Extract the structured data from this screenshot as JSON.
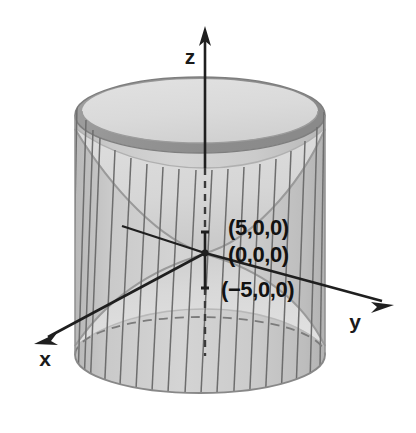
{
  "figure": {
    "background_color": "#ffffff",
    "width": 416,
    "height": 433
  },
  "axes": {
    "z": {
      "label": "z",
      "label_x": 190,
      "label_y": 64,
      "tip_x": 205,
      "tip_y": 30,
      "origin_x": 205,
      "origin_y": 253
    },
    "y": {
      "label": "y",
      "label_x": 355,
      "label_y": 329,
      "tip_x": 392,
      "tip_y": 306,
      "origin_x": 205,
      "origin_y": 253
    },
    "x": {
      "label": "x",
      "label_x": 45,
      "label_y": 366,
      "tip_x": 36,
      "tip_y": 343,
      "origin_x": 205,
      "origin_y": 253
    },
    "negative_y_stub": {
      "end_x": 122,
      "end_y": 226
    }
  },
  "point_labels": [
    {
      "name": "point-label-positive-x",
      "text": "(5,0,0)",
      "x": 228,
      "y": 235
    },
    {
      "name": "point-label-origin",
      "text": "(0,0,0)",
      "x": 228,
      "y": 262
    },
    {
      "name": "point-label-negative-x",
      "text": "(−5,0,0)",
      "x": 221,
      "y": 297
    }
  ],
  "colors": {
    "cylinder_body": "#c9c9c9",
    "cylinder_body_light": "#d7d7d7",
    "cylinder_rim_band": "#9b9b9b",
    "cylinder_rim_band_dark": "#8c8c8c",
    "hyperboloid_inner": "#dcdcdc",
    "hyperboloid_inner_shade": "#cfcfcf",
    "ruling_line": "#6d6d6d",
    "axis_stroke": "#1f1f1f",
    "hidden_edge": "#7b7b7b",
    "label_text": "#121212"
  },
  "geometry": {
    "cylinder": {
      "center_x": 200,
      "radius_x": 125,
      "top_center_y": 115,
      "bottom_center_y": 355,
      "ellipse_radius_y": 38,
      "rim_band_thickness": 15
    },
    "hyperboloid": {
      "waist_center_x": 205,
      "waist_center_y": 253,
      "waist_radius_x": 23,
      "waist_radius_y": 7,
      "top_flare_y": 150,
      "bottom_flare_y": 352
    },
    "ruling_lines_count": 19
  }
}
